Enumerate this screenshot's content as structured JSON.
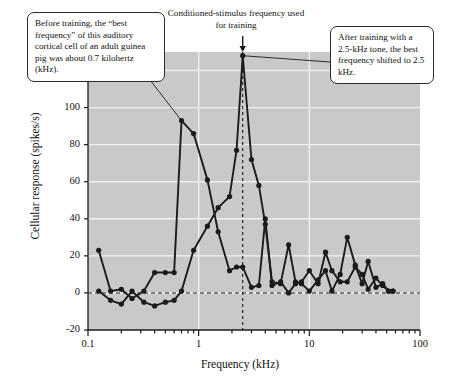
{
  "figure": {
    "plot_bg": "#c9c9c9",
    "ink": "#1b1b1b",
    "grid_color": "#f0f0f0"
  },
  "annotations": {
    "left_callout": "Before training, the “best frequency” of this auditory cortical cell of an adult guinea pig was about 0.7 kilohertz (kHz).",
    "top_callout": "Conditioned-stimulus frequency used for training",
    "right_callout": "After training with a 2.5-kHz tone, the best frequency shifted to 2.5 kHz."
  },
  "chart_data": {
    "type": "line",
    "title": "",
    "xlabel": "Frequency (kHz)",
    "ylabel": "Cellular response (spikes/s)",
    "xscale": "log",
    "xlim": [
      0.1,
      100
    ],
    "ylim": [
      -20,
      130
    ],
    "yticks": [
      -20,
      0,
      20,
      40,
      60,
      80,
      100,
      120
    ],
    "ytick_labels": [
      "-20",
      "0",
      "20",
      "40",
      "60",
      "80",
      "100",
      "120"
    ],
    "xticks": [
      0.1,
      1,
      10,
      100
    ],
    "xtick_labels": [
      "0.1",
      "1",
      "10",
      "100"
    ],
    "grid": "horizontal",
    "legend": "none",
    "markers": "filled-circle",
    "reference_lines": [
      {
        "name": "zero-response-line",
        "axis": "y",
        "value": 0,
        "style": "dashed"
      },
      {
        "name": "conditioned-stimulus-line",
        "axis": "x",
        "value": 2.5,
        "style": "dashed"
      }
    ],
    "series": [
      {
        "name": "Before training",
        "best_frequency_khz": 0.7,
        "peak_value": 93,
        "points": [
          [
            0.125,
            23
          ],
          [
            0.16,
            1
          ],
          [
            0.2,
            2
          ],
          [
            0.25,
            -3
          ],
          [
            0.32,
            1
          ],
          [
            0.4,
            11
          ],
          [
            0.5,
            11
          ],
          [
            0.6,
            11
          ],
          [
            0.7,
            93
          ],
          [
            0.9,
            86
          ],
          [
            1.2,
            61
          ],
          [
            1.5,
            33
          ],
          [
            1.9,
            12
          ],
          [
            2.2,
            14
          ],
          [
            2.5,
            14
          ],
          [
            3.0,
            3
          ],
          [
            3.5,
            4
          ],
          [
            4.0,
            40
          ],
          [
            4.6,
            4
          ],
          [
            5.5,
            6
          ],
          [
            6.5,
            0
          ],
          [
            7.5,
            5
          ],
          [
            8.5,
            6
          ],
          [
            10,
            12
          ],
          [
            12,
            5
          ],
          [
            14,
            22
          ],
          [
            16,
            12
          ],
          [
            19,
            6
          ],
          [
            22,
            6
          ],
          [
            26,
            14
          ],
          [
            30,
            10
          ],
          [
            34,
            2
          ],
          [
            40,
            8
          ],
          [
            46,
            4
          ],
          [
            52,
            1
          ],
          [
            57,
            1
          ]
        ]
      },
      {
        "name": "After training",
        "best_frequency_khz": 2.5,
        "peak_value": 128,
        "points": [
          [
            0.125,
            1
          ],
          [
            0.16,
            -4
          ],
          [
            0.2,
            -6
          ],
          [
            0.25,
            1
          ],
          [
            0.32,
            -5
          ],
          [
            0.4,
            -7
          ],
          [
            0.5,
            -5
          ],
          [
            0.6,
            -4
          ],
          [
            0.7,
            1
          ],
          [
            0.9,
            23
          ],
          [
            1.2,
            36
          ],
          [
            1.5,
            46
          ],
          [
            1.9,
            52
          ],
          [
            2.2,
            77
          ],
          [
            2.5,
            128
          ],
          [
            3.0,
            72
          ],
          [
            3.5,
            58
          ],
          [
            4.0,
            37
          ],
          [
            4.6,
            6
          ],
          [
            5.5,
            5
          ],
          [
            6.5,
            26
          ],
          [
            7.5,
            6
          ],
          [
            8.5,
            5
          ],
          [
            10,
            1
          ],
          [
            12,
            7
          ],
          [
            14,
            12
          ],
          [
            16,
            1
          ],
          [
            19,
            10
          ],
          [
            22,
            30
          ],
          [
            26,
            15
          ],
          [
            30,
            5
          ],
          [
            34,
            17
          ],
          [
            40,
            3
          ],
          [
            46,
            5
          ],
          [
            52,
            1
          ],
          [
            57,
            1
          ]
        ]
      }
    ]
  }
}
